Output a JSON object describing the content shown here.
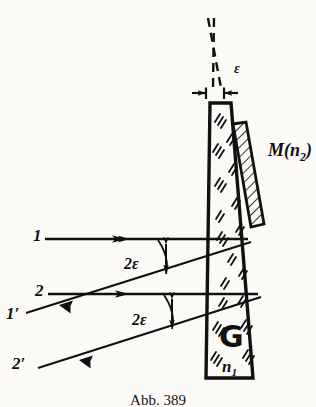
{
  "figure": {
    "caption": "Abb. 389",
    "prism": {
      "glass_label": "G",
      "index_label": "n",
      "index_sub": "1"
    },
    "mirror": {
      "label_main": "M(n",
      "label_sub": "2",
      "label_close": ")"
    },
    "angles": {
      "apex": "ε",
      "upper_deviation": "2ε",
      "lower_deviation": "2ε"
    },
    "rays": {
      "incident_upper": "1",
      "incident_lower": "2",
      "reflected_upper": "1′",
      "reflected_lower": "2′"
    },
    "colors": {
      "ink": "#111111",
      "paper": "#fbfaf7",
      "hatch": "#1a1a1a"
    }
  }
}
